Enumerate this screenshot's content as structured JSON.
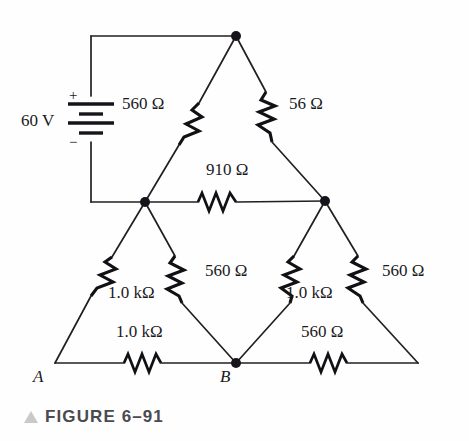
{
  "figure": {
    "caption": "FIGURE 6–91",
    "marker_icon": "triangle-up-icon"
  },
  "source": {
    "voltage_label": "60 V",
    "plus_sign": "+",
    "minus_sign": "−",
    "symbol": "battery-icon"
  },
  "nodes": [
    {
      "id": "top",
      "label": "",
      "x": 236,
      "y": 36
    },
    {
      "id": "mid-left",
      "label": "",
      "x": 145,
      "y": 202
    },
    {
      "id": "mid-right",
      "label": "",
      "x": 325,
      "y": 201
    },
    {
      "id": "bottom-mid",
      "label": "B",
      "x": 236,
      "y": 363
    },
    {
      "id": "bottom-left",
      "label": "A",
      "x": 55,
      "y": 363
    },
    {
      "id": "bottom-right",
      "label": "",
      "x": 418,
      "y": 363
    }
  ],
  "node_labels": {
    "a": "A",
    "b": "B"
  },
  "resistors": [
    {
      "id": "r-top-left",
      "value": "560 Ω",
      "orientation": "diagonal"
    },
    {
      "id": "r-top-right",
      "value": "56 Ω",
      "orientation": "diagonal"
    },
    {
      "id": "r-middle",
      "value": "910 Ω",
      "orientation": "horizontal"
    },
    {
      "id": "r-lower-left",
      "value": "1.0 kΩ",
      "orientation": "diagonal"
    },
    {
      "id": "r-lower-inner-l",
      "value": "560 Ω",
      "orientation": "diagonal"
    },
    {
      "id": "r-lower-inner-r",
      "value": "1.0 kΩ",
      "orientation": "diagonal"
    },
    {
      "id": "r-lower-right",
      "value": "560 Ω",
      "orientation": "diagonal"
    },
    {
      "id": "r-bottom-left",
      "value": "1.0 kΩ",
      "orientation": "horizontal"
    },
    {
      "id": "r-bottom-right",
      "value": "560 Ω",
      "orientation": "horizontal"
    }
  ],
  "colors": {
    "wire": "#231f20",
    "text": "#1a1a1c",
    "caption": "#4a4a4f",
    "marker": "#c9c9cc",
    "background": "#ffffff"
  }
}
